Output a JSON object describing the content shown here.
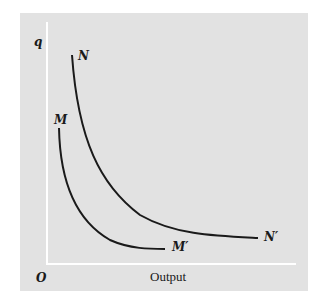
{
  "figure": {
    "y_axis_label": "q",
    "x_axis_label": "Output",
    "origin_label": "O",
    "curves": [
      {
        "name": "N",
        "start_label": "N",
        "end_label": "N′"
      },
      {
        "name": "M",
        "start_label": "M",
        "end_label": "M′"
      }
    ],
    "colors": {
      "panel": "#e2e2e2",
      "axis": "#ffffff",
      "curve": "#1a1a1a"
    }
  }
}
